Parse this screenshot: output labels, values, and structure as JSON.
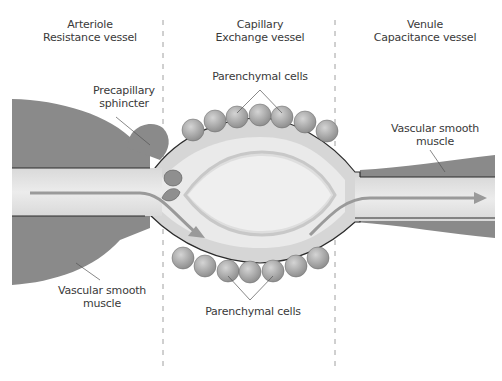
{
  "sections": [
    {
      "title": "Arteriole",
      "subtitle": "Resistance vessel"
    },
    {
      "title": "Capillary",
      "subtitle": "Exchange vessel"
    },
    {
      "title": "Venule",
      "subtitle": "Capacitance vessel"
    }
  ],
  "labels": {
    "precapillary_sphincter_1": "Precapillary",
    "precapillary_sphincter_2": "sphincter",
    "parenchymal_top": "Parenchymal cells",
    "parenchymal_bottom": "Parenchymal cells",
    "vsm_right_1": "Vascular smooth",
    "vsm_right_2": "muscle",
    "vsm_left_1": "Vascular smooth",
    "vsm_left_2": "muscle"
  },
  "colors": {
    "muscle": "#8a8a8a",
    "lumen": "#e6e6e6",
    "wall": "#cfcfcf",
    "cell": "#a9a9a9",
    "arrow": "#9a9a9a",
    "text": "#3a3a3a"
  }
}
